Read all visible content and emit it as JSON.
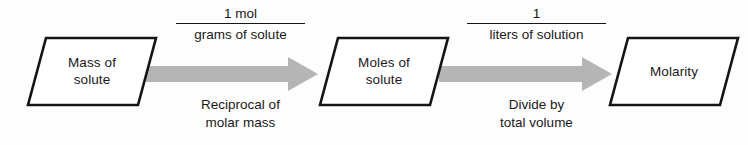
{
  "diagram": {
    "colors": {
      "background": "#fdfdfd",
      "outline": "#141414",
      "arrow_fill": "#b5b5b5",
      "text": "#1a1a1a"
    },
    "nodes": [
      {
        "id": "mass-of-solute",
        "lines": [
          "Mass of",
          "solute"
        ]
      },
      {
        "id": "moles-of-solute",
        "lines": [
          "Moles of",
          "solute"
        ]
      },
      {
        "id": "molarity",
        "lines": [
          "Molarity"
        ]
      }
    ],
    "arrows": [
      {
        "id": "mass-to-moles",
        "fraction": {
          "numerator": "1 mol",
          "denominator": "grams of solute"
        },
        "caption": [
          "Reciprocal of",
          "molar mass"
        ]
      },
      {
        "id": "moles-to-molarity",
        "fraction": {
          "numerator": "1",
          "denominator": "liters of solution"
        },
        "caption": [
          "Divide by",
          "total volume"
        ]
      }
    ]
  }
}
